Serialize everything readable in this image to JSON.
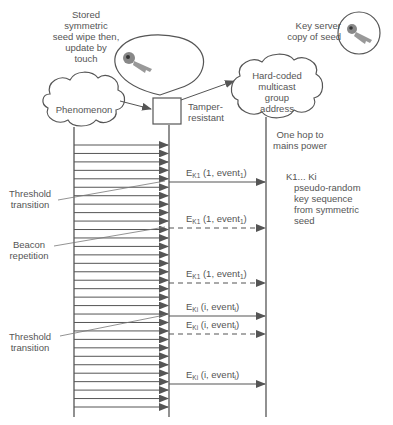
{
  "diagram": {
    "nodes": {
      "stored_seed": {
        "label_lines": [
          "Stored",
          "symmetric",
          "seed wipe then,",
          "update by",
          "touch"
        ]
      },
      "key_server": {
        "label_lines": [
          "Key server",
          "copy of seed"
        ]
      },
      "phenomenon": {
        "label": "Phenomenon"
      },
      "tamper": {
        "label_lines": [
          "Tamper-",
          "resistant"
        ]
      },
      "multicast": {
        "label_lines": [
          "Hard-coded",
          "multicast",
          "group",
          "address"
        ]
      },
      "one_hop": {
        "label_lines": [
          "One hop to",
          "mains power"
        ]
      }
    },
    "annotations": {
      "threshold_1": {
        "label_lines": [
          "Threshold",
          "transition"
        ]
      },
      "beacon": {
        "label_lines": [
          "Beacon",
          "repetition"
        ]
      },
      "threshold_2": {
        "label_lines": [
          "Threshold",
          "transition"
        ]
      },
      "key_sequence": {
        "label_lines": [
          "K1... Ki",
          "pseudo-random",
          "key sequence",
          "from symmetric",
          "seed"
        ]
      }
    },
    "sample_arrow_count": 32,
    "messages": [
      {
        "E": "E",
        "sub": "K1",
        "args": " (1, event",
        "argsub": "1",
        "close": ")",
        "style": "solid",
        "y": 182
      },
      {
        "E": "E",
        "sub": "K1",
        "args": " (1, event",
        "argsub": "1",
        "close": ")",
        "style": "dashed",
        "y": 228
      },
      {
        "E": "E",
        "sub": "K1",
        "args": " (1, event",
        "argsub": "1",
        "close": ")",
        "style": "dashed",
        "y": 283
      },
      {
        "E": "E",
        "sub": "Ki",
        "args": " (i, event",
        "argsub": "i",
        "close": ")",
        "style": "solid",
        "y": 316
      },
      {
        "E": "E",
        "sub": "Ki",
        "args": " (i, event",
        "argsub": "i",
        "close": ")",
        "style": "dashed",
        "y": 334
      },
      {
        "E": "E",
        "sub": "Ki",
        "args": " (i, event",
        "argsub": "i",
        "close": ")",
        "style": "solid",
        "y": 384
      }
    ],
    "colors": {
      "line": "#555555",
      "text": "#555555",
      "key": "#777777"
    }
  }
}
